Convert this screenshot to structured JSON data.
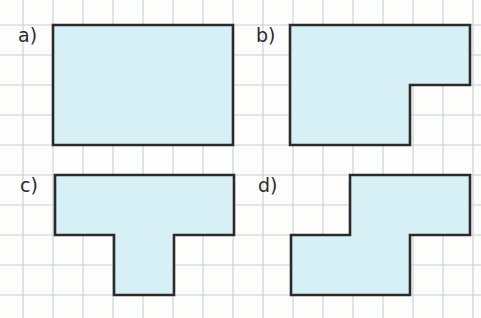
{
  "page": {
    "background_color": "#fdfdfb",
    "width": 481,
    "height": 318
  },
  "grid": {
    "cell_size": 30,
    "origin_x": -7,
    "origin_y": -5,
    "line_color": "#c9cfd6",
    "line_width": 1.1,
    "visible": true
  },
  "style": {
    "fill_color": "#d7f0f6",
    "stroke_color": "#2b2b2b",
    "stroke_width": 2.6,
    "label_color": "#2b2b2b",
    "label_font_size": "19px"
  },
  "shapes": [
    {
      "id": "a",
      "label": "a)",
      "label_x": 18,
      "label_y": 42,
      "description": "rectangle 6 by 4 cells",
      "cells_wide": 6,
      "cells_tall": 4,
      "area_cells": 24,
      "perimeter_cells": 20,
      "points": "53,25 233,25 233,145 53,145"
    },
    {
      "id": "b",
      "label": "b)",
      "label_x": 256,
      "label_y": 42,
      "description": "L shape, 6 by 2 top row band with 4 by 2 bottom band",
      "area_cells": 20,
      "perimeter_cells": 20,
      "points": "290,25 470,25 470,85 410,85 410,145 290,145"
    },
    {
      "id": "c",
      "label": "c)",
      "label_x": 20,
      "label_y": 192,
      "description": "T shape, 6 by 2 top bar with 2 by 2 centered stem",
      "area_cells": 16,
      "perimeter_cells": 20,
      "points": "55,175 234,175 234,235 174,235 174,295 114,295 114,235 55,235"
    },
    {
      "id": "d",
      "label": "d)",
      "label_x": 258,
      "label_y": 192,
      "description": "Z shape, 4 by 2 upper band offset right over 4 by 2 lower band offset left",
      "area_cells": 16,
      "perimeter_cells": 20,
      "points": "350,175 470,175 470,235 410,235 410,295 291,295 291,235 350,235"
    }
  ]
}
